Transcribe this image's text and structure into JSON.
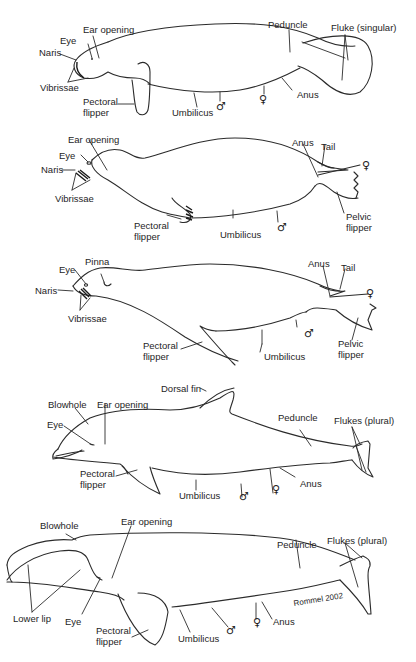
{
  "figure": {
    "credit": "Rommel 2002",
    "colors": {
      "line": "#2b2b2b",
      "text": "#1e1e1e",
      "background": "#ffffff"
    }
  },
  "manatee": {
    "labels": {
      "eye": "Eye",
      "ear_opening": "Ear opening",
      "naris": "Naris",
      "vibrissae": "Vibrissae",
      "pectoral_flipper_1": "Pectoral",
      "pectoral_flipper_2": "flipper",
      "umbilicus": "Umbilicus",
      "peduncle": "Peduncle",
      "fluke": "Fluke (singular)",
      "anus": "Anus",
      "male": "♂",
      "female": "♀"
    }
  },
  "seal": {
    "labels": {
      "ear_opening": "Ear opening",
      "eye": "Eye",
      "naris": "Naris",
      "vibrissae": "Vibrissae",
      "pectoral_flipper_1": "Pectoral",
      "pectoral_flipper_2": "flipper",
      "umbilicus": "Umbilicus",
      "anus": "Anus",
      "tail": "Tail",
      "pelvic_flipper_1": "Pelvic",
      "pelvic_flipper_2": "flipper",
      "male": "♂",
      "female": "♀"
    }
  },
  "sea_lion": {
    "labels": {
      "pinna": "Pinna",
      "eye": "Eye",
      "naris": "Naris",
      "vibrissae": "Vibrissae",
      "pectoral_flipper_1": "Pectoral",
      "pectoral_flipper_2": "flipper",
      "umbilicus": "Umbilicus",
      "anus": "Anus",
      "tail": "Tail",
      "pelvic_flipper_1": "Pelvic",
      "pelvic_flipper_2": "flipper",
      "male": "♂",
      "female": "♀"
    }
  },
  "dolphin": {
    "labels": {
      "dorsal_fin": "Dorsal fin",
      "blowhole": "Blowhole",
      "ear_opening": "Ear opening",
      "eye": "Eye",
      "pectoral_flipper_1": "Pectoral",
      "pectoral_flipper_2": "flipper",
      "umbilicus": "Umbilicus",
      "peduncle": "Peduncle",
      "flukes": "Flukes (plural)",
      "anus": "Anus",
      "male": "♂",
      "female": "♀"
    }
  },
  "whale": {
    "labels": {
      "blowhole": "Blowhole",
      "ear_opening": "Ear opening",
      "lower_lip": "Lower lip",
      "eye": "Eye",
      "pectoral_flipper_1": "Pectoral",
      "pectoral_flipper_2": "flipper",
      "umbilicus": "Umbilicus",
      "peduncle": "Peduncle",
      "flukes": "Flukes (plural)",
      "anus": "Anus",
      "male": "♂",
      "female": "♀"
    }
  }
}
